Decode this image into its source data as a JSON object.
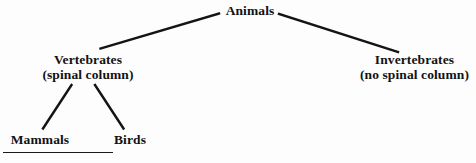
{
  "diagram": {
    "type": "hierarchy-tree",
    "background_color": "#fdfdfd",
    "line_color": "#141414",
    "text_color": "#121212",
    "nodes": {
      "root": {
        "label": "Animals",
        "sublabel": ""
      },
      "vertebrates": {
        "label": "Vertebrates",
        "sublabel": "(spinal column)"
      },
      "invertebrates": {
        "label": "Invertebrates",
        "sublabel": "(no spinal column)"
      },
      "mammals": {
        "label": "Mammals",
        "sublabel": ""
      },
      "birds": {
        "label": "Birds",
        "sublabel": ""
      }
    },
    "edges": [
      {
        "from": "root",
        "to": "vertebrates"
      },
      {
        "from": "root",
        "to": "invertebrates"
      },
      {
        "from": "vertebrates",
        "to": "mammals"
      },
      {
        "from": "vertebrates",
        "to": "birds"
      }
    ]
  }
}
